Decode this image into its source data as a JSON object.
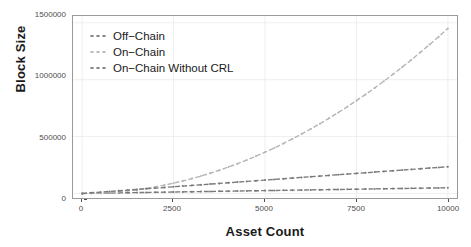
{
  "chart_data": {
    "type": "line",
    "title": "",
    "xlabel": "Asset Count",
    "ylabel": "Block Size",
    "xlim": [
      -250,
      10250
    ],
    "ylim": [
      -40000,
      1560000
    ],
    "xticks": [
      0,
      2500,
      5000,
      7500,
      10000
    ],
    "xticklabels": [
      "0",
      "2500",
      "5000",
      "7500",
      "10000"
    ],
    "yticks": [
      0,
      500000,
      1000000,
      1500000
    ],
    "yticklabels": [
      "0",
      "500000",
      "1000000",
      "1500000"
    ],
    "grid": true,
    "grid_color": "#ebebeb",
    "legend_position": "top-left-inside",
    "x": [
      0,
      250,
      500,
      750,
      1000,
      1250,
      1500,
      1750,
      2000,
      2250,
      2500,
      2750,
      3000,
      3250,
      3500,
      3750,
      4000,
      4250,
      4500,
      4750,
      5000,
      5250,
      5500,
      5750,
      6000,
      6250,
      6500,
      6750,
      7000,
      7250,
      7500,
      7750,
      8000,
      8250,
      8500,
      8750,
      9000,
      9250,
      9500,
      9750,
      10000
    ],
    "series": [
      {
        "name": "Off-Chain",
        "label": "Off−Chain",
        "color": "#7a7a7a",
        "linestyle": "dashed",
        "marker": "point",
        "values": [
          0,
          1250,
          2500,
          3750,
          5000,
          6250,
          7500,
          8750,
          10000,
          11250,
          12500,
          13750,
          15000,
          16250,
          17500,
          18750,
          20000,
          21250,
          22500,
          23750,
          25000,
          26250,
          27500,
          28750,
          30000,
          31250,
          32500,
          33750,
          35000,
          36250,
          37500,
          38750,
          40000,
          41250,
          42500,
          43750,
          45000,
          46250,
          47500,
          48750,
          50000
        ]
      },
      {
        "name": "On-Chain",
        "label": "On−Chain",
        "color": "#b5b5b5",
        "linestyle": "dashed",
        "marker": "point",
        "values": [
          0,
          4200,
          9000,
          14400,
          20400,
          27000,
          34200,
          42000,
          50400,
          59400,
          69000,
          79200,
          90000,
          101400,
          113400,
          126000,
          139200,
          153000,
          167400,
          182400,
          198000,
          214200,
          231000,
          248400,
          266400,
          285000,
          304200,
          324000,
          344400,
          365400,
          387000,
          409200,
          432000,
          455400,
          479400,
          504000,
          529200,
          555000,
          581400,
          608400,
          636000
        ]
      },
      {
        "name": "On-Chain Without CRL",
        "label": "On−Chain Without CRL",
        "color": "#7a7a7a",
        "linestyle": "dashed",
        "marker": "point",
        "values": [
          0,
          5875,
          11750,
          17625,
          23500,
          29375,
          35250,
          41125,
          47000,
          52875,
          58750,
          64625,
          70500,
          76375,
          82250,
          88125,
          94000,
          99875,
          105750,
          111625,
          117500,
          123375,
          129250,
          135125,
          141000,
          146875,
          152750,
          158625,
          164500,
          170375,
          176250,
          182125,
          188000,
          193875,
          199750,
          205625,
          211500,
          217375,
          223250,
          229125,
          235000
        ]
      }
    ],
    "series_render": [
      {
        "name": "On-Chain",
        "color": "#b5b5b5",
        "values": [
          0,
          9000,
          20000,
          33000,
          48000,
          66000,
          86000,
          108000,
          133000,
          160000,
          190000,
          222000,
          257000,
          294000,
          334000,
          376000,
          421000,
          468000,
          518000,
          570000,
          625000,
          682000,
          742000,
          804000,
          869000,
          936000,
          1006000,
          1078000,
          1153000,
          1230000,
          1310000,
          1392000,
          1477000,
          1564000,
          1654000,
          1746000,
          1841000,
          1938000,
          2038000,
          2140000,
          2245000
        ]
      }
    ]
  },
  "legend": {
    "items": [
      {
        "label": "Off−Chain",
        "color": "#7a7a7a"
      },
      {
        "label": "On−Chain",
        "color": "#b5b5b5"
      },
      {
        "label": "On−Chain Without CRL",
        "color": "#7a7a7a"
      }
    ]
  },
  "axes": {
    "xlabel": "Asset Count",
    "ylabel": "Block Size",
    "xticklabels": [
      "0",
      "2500",
      "5000",
      "7500",
      "10000"
    ],
    "yticklabels": [
      "0",
      "500000",
      "1000000",
      "1500000"
    ]
  },
  "colors": {
    "panel_border": "#9a9a9a",
    "grid": "#ebebeb",
    "tick_text": "#4d4d4d",
    "axis_title": "#1a1a1a",
    "background": "#ffffff"
  }
}
